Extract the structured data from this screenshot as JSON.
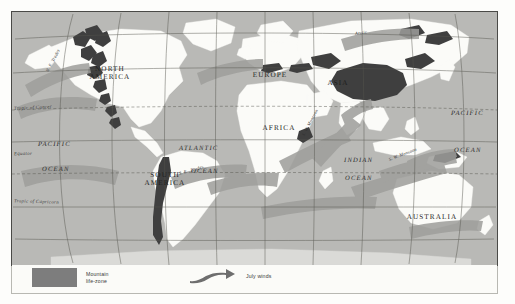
{
  "figure": {
    "type": "world-map",
    "title_visible": false,
    "projection_note": "oval world projection"
  },
  "map": {
    "continents": [
      {
        "name": "NORTH\nAMERICA",
        "x": 92,
        "y": 60
      },
      {
        "name": "SOUTH\nAMERICA",
        "x": 150,
        "y": 166
      },
      {
        "name": "EUROPE",
        "x": 258,
        "y": 64
      },
      {
        "name": "AFRICA",
        "x": 267,
        "y": 117
      },
      {
        "name": "ASIA",
        "x": 326,
        "y": 72
      },
      {
        "name": "AUSTRALIA",
        "x": 419,
        "y": 206
      }
    ],
    "oceans": [
      {
        "name": "PACIFIC",
        "x": 48,
        "y": 134
      },
      {
        "name": "OCEAN",
        "x": 49,
        "y": 159
      },
      {
        "name": "ATLANTIC",
        "x": 193,
        "y": 138
      },
      {
        "name": "OCEAN",
        "x": 199,
        "y": 161
      },
      {
        "name": "PACIFIC",
        "x": 462,
        "y": 103
      },
      {
        "name": "OCEAN",
        "x": 463,
        "y": 140
      },
      {
        "name": "INDIAN",
        "x": 352,
        "y": 150
      },
      {
        "name": "OCEAN",
        "x": 352,
        "y": 168
      }
    ],
    "graticule_labels": [
      {
        "name": "Tropic of Cancer",
        "x": 14,
        "y": 110
      },
      {
        "name": "Equator",
        "x": 14,
        "y": 155
      },
      {
        "name": "Tropic of Capricorn",
        "x": 14,
        "y": 203
      }
    ],
    "wind_labels": [
      {
        "name": "S. W. Monsoon",
        "x": 318,
        "y": 132,
        "rotate": -62
      },
      {
        "name": "S. W. Monsoon",
        "x": 402,
        "y": 152,
        "rotate": -22
      },
      {
        "name": "S. E.  Trades",
        "x": 191,
        "y": 165,
        "rotate": -18
      },
      {
        "name": "N. E. Trades",
        "x": 58,
        "y": 64,
        "rotate": -60
      },
      {
        "name": "Arctic",
        "x": 356,
        "y": 35,
        "rotate": -8
      }
    ]
  },
  "legend": {
    "items": [
      {
        "key": "mountain-life-zone",
        "label": "Mountain\nlife-zone",
        "symbol": "filled-rectangle",
        "color": "#7d7d7d"
      },
      {
        "key": "july-winds",
        "label": "July winds",
        "symbol": "wind-arrow",
        "color": "#6e6e6e"
      }
    ]
  },
  "colors": {
    "ocean_fill": "#b9b9b6",
    "land_fill": "#fbfbf8",
    "mountain_fill": "#4a4a4a",
    "wind_fill": "#8c8c8a",
    "graticule": "#555552",
    "frame": "#4a4a47",
    "page_background": "#ffffff"
  }
}
